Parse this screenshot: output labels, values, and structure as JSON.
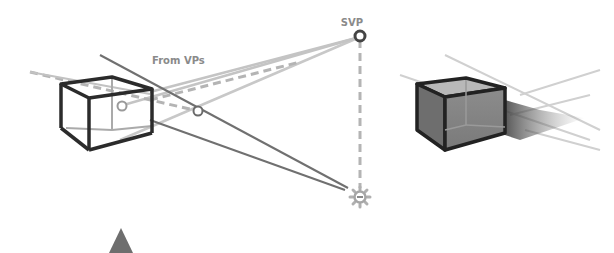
{
  "diagram": {
    "labels": {
      "svp": "SVP",
      "from_vps": "From VPs"
    },
    "colors": {
      "horizon": "#d8d8d8",
      "dark_line": "#6a6a6a",
      "light_line": "#bdbdbd",
      "dashed": "#b0b0b0",
      "cube_edge": "#2b2b2b",
      "sun": "#a8a8a8",
      "triangle": "#6e6e6e"
    },
    "icons": [
      "svp-marker-icon",
      "vanishing-point-icon",
      "sun-icon",
      "viewer-triangle-icon"
    ]
  }
}
